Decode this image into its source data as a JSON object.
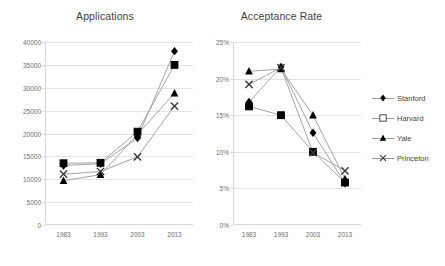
{
  "legend": {
    "position": "right",
    "entries": [
      {
        "label": "Stanford",
        "marker": "filled-diamond",
        "color": "#000000"
      },
      {
        "label": "Harvard",
        "marker": "hollow-square",
        "color": "#000000"
      },
      {
        "label": "Yale",
        "marker": "filled-triangle",
        "color": "#000000"
      },
      {
        "label": "Princeton",
        "marker": "x-cross",
        "color": "#000000"
      }
    ]
  },
  "chart_data": [
    {
      "type": "line",
      "title": "Applications",
      "xlabel": "",
      "ylabel": "",
      "categories": [
        "1983",
        "1993",
        "2003",
        "2013"
      ],
      "ylim": [
        0,
        40000
      ],
      "yticks": [
        "0",
        "5000",
        "10000",
        "15000",
        "20000",
        "25000",
        "30000",
        "35000",
        "40000"
      ],
      "ytick_values": [
        0,
        5000,
        10000,
        15000,
        20000,
        25000,
        30000,
        35000,
        40000
      ],
      "grid": true,
      "line_color": "#9a9a9a",
      "series": [
        {
          "name": "Stanford",
          "marker": "filled-diamond",
          "values": [
            13000,
            13400,
            19000,
            38000
          ]
        },
        {
          "name": "Harvard",
          "marker": "hollow-square",
          "values": [
            13500,
            13600,
            20400,
            35000
          ]
        },
        {
          "name": "Yale",
          "marker": "filled-triangle",
          "values": [
            9700,
            11000,
            19800,
            28800
          ]
        },
        {
          "name": "Princeton",
          "marker": "x-cross",
          "values": [
            11100,
            11700,
            14900,
            26000
          ]
        }
      ]
    },
    {
      "type": "line",
      "title": "Acceptance Rate",
      "xlabel": "",
      "ylabel": "",
      "categories": [
        "1983",
        "1993",
        "2003",
        "2013"
      ],
      "ylim": [
        0,
        25
      ],
      "yticks": [
        "0%",
        "5%",
        "10%",
        "15%",
        "20%",
        "25%"
      ],
      "ytick_values": [
        0,
        5,
        10,
        15,
        20,
        25
      ],
      "grid": true,
      "line_color": "#9a9a9a",
      "series": [
        {
          "name": "Stanford",
          "marker": "filled-diamond",
          "values": [
            16.8,
            21.6,
            12.6,
            5.7
          ]
        },
        {
          "name": "Harvard",
          "marker": "hollow-square",
          "values": [
            16.2,
            15.0,
            10.0,
            5.8
          ]
        },
        {
          "name": "Yale",
          "marker": "filled-triangle",
          "values": [
            21.0,
            21.3,
            15.0,
            6.3
          ]
        },
        {
          "name": "Princeton",
          "marker": "x-cross",
          "values": [
            19.2,
            21.5,
            9.9,
            7.4
          ]
        }
      ]
    }
  ]
}
